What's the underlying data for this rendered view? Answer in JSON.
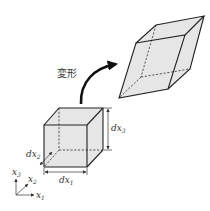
{
  "diagram": {
    "deformation_label": "変形",
    "dimension_labels": {
      "dx1": {
        "base": "dx",
        "sub": "1"
      },
      "dx2": {
        "base": "dx",
        "sub": "2"
      },
      "dx3": {
        "base": "dx",
        "sub": "3"
      }
    },
    "axes": {
      "x1": {
        "base": "x",
        "sub": "1"
      },
      "x2": {
        "base": "x",
        "sub": "2"
      },
      "x3": {
        "base": "x",
        "sub": "3"
      }
    },
    "colors": {
      "face_fill": "#e6e6e6",
      "edge": "#222222",
      "arrow": "#111111"
    }
  }
}
